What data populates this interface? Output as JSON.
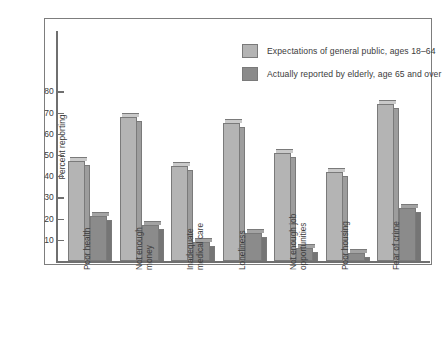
{
  "chart_data": {
    "type": "bar",
    "title": "",
    "xlabel": "",
    "ylabel": "Percent reporting",
    "ylim": [
      0,
      85
    ],
    "grid": false,
    "legend_position": "top-right",
    "yticks": [
      10,
      20,
      30,
      40,
      50,
      60,
      70,
      80
    ],
    "ytick_labels": [
      "10",
      "20",
      "30",
      "40",
      "50",
      "60",
      "70",
      "80"
    ],
    "categories": [
      "Poor health",
      "Not enough\nmoney",
      "Inadequate\nmedical care",
      "Loneliness",
      "Not enough job\nopportunities",
      "Poor housing",
      "Fear of crime"
    ],
    "series": [
      {
        "name": "Expectations of general public, ages 18–64",
        "color": "#b4b4b4",
        "values": [
          47,
          68,
          45,
          65,
          51,
          42,
          74
        ]
      },
      {
        "name": "Actually reported by elderly, age 65 and over",
        "color": "#8b8b8b",
        "values": [
          21,
          17,
          9,
          13,
          6,
          4,
          25
        ]
      }
    ]
  },
  "legend": {
    "items": [
      {
        "label": "Expectations of general public, ages 18–64",
        "color": "#b4b4b4"
      },
      {
        "label": "Actually reported by elderly, age 65 and over",
        "color": "#8b8b8b"
      }
    ]
  },
  "colors": {
    "light_bar": "#b4b4b4",
    "light_bar_side": "#9d9d9d",
    "light_bar_top": "#c9c9c9",
    "dark_bar": "#8b8b8b",
    "dark_bar_side": "#757575",
    "dark_bar_top": "#a3a3a3",
    "axis": "#6f6f6f",
    "frame": "#7d7d7d",
    "text": "#3b3b3b",
    "background": "#ffffff"
  }
}
